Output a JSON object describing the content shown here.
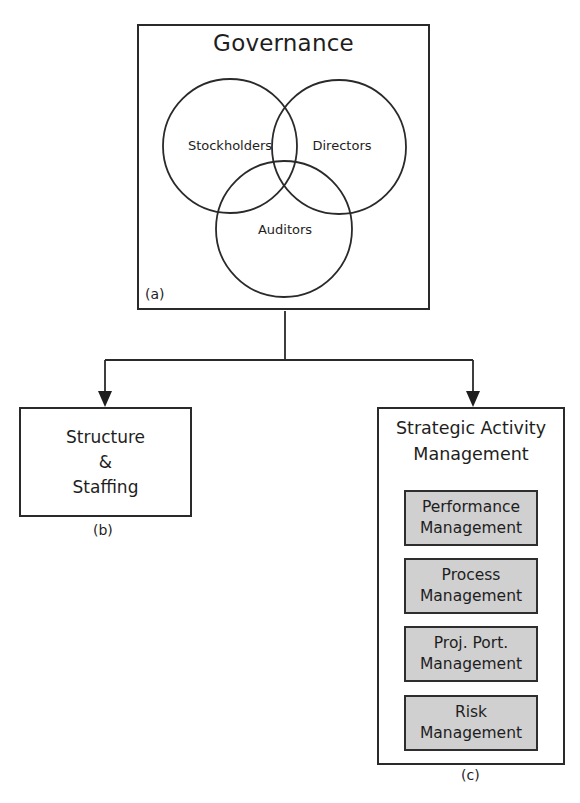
{
  "governance": {
    "title": "Governance",
    "panel_label": "(a)",
    "circles": [
      {
        "label": "Stockholders"
      },
      {
        "label": "Directors"
      },
      {
        "label": "Auditors"
      }
    ]
  },
  "structure_staffing": {
    "line1": "Structure",
    "line2": "&",
    "line3": "Staffing",
    "panel_label": "(b)"
  },
  "strategic_activity": {
    "title_line1": "Strategic Activity",
    "title_line2": "Management",
    "panel_label": "(c)",
    "items": [
      {
        "line1": "Performance",
        "line2": "Management"
      },
      {
        "line1": "Process",
        "line2": "Management"
      },
      {
        "line1": "Proj. Port.",
        "line2": "Management"
      },
      {
        "line1": "Risk",
        "line2": "Management"
      }
    ]
  },
  "colors": {
    "line": "#2a2a2a",
    "sub_box_fill": "#d0d0d0",
    "background": "#ffffff"
  }
}
